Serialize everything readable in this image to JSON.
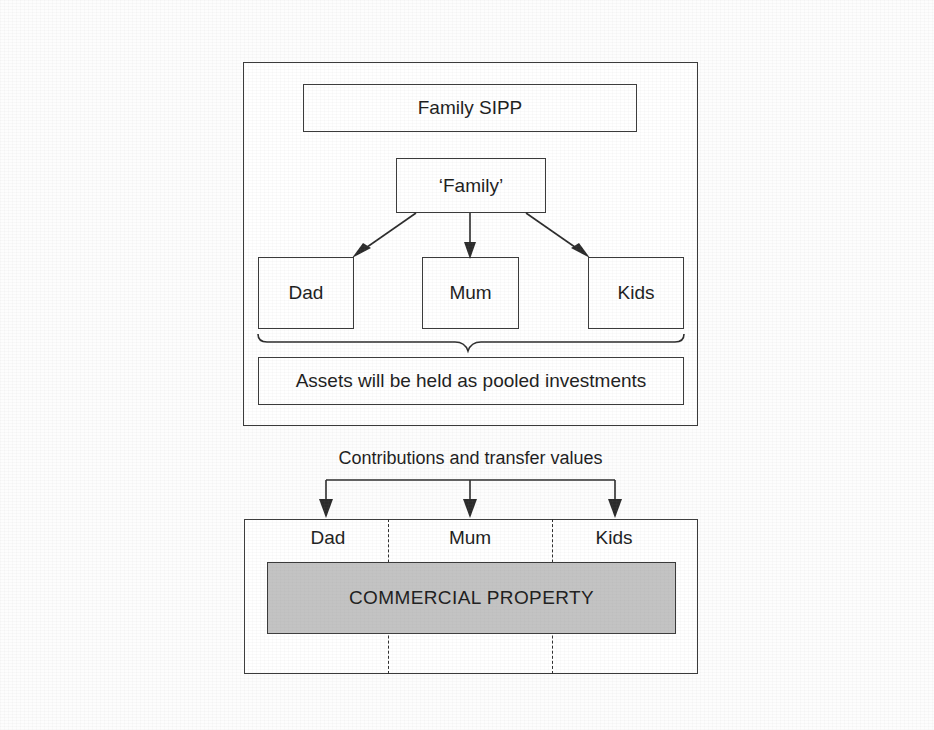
{
  "figure": {
    "background_color": "#fdfdfd",
    "line_color": "#2b2b2b",
    "shaded_fill_color": "#c3c3c3"
  },
  "top_panel": {
    "scheme_box": {
      "label": "Family SIPP"
    },
    "family_box": {
      "label": "‘Family’"
    },
    "member_boxes": [
      {
        "label": "Dad"
      },
      {
        "label": "Mum"
      },
      {
        "label": "Kids"
      }
    ],
    "pooled_box": {
      "label": "Assets will be held as pooled investments"
    }
  },
  "connector_caption": {
    "label": "Contributions and transfer values"
  },
  "bottom_panel": {
    "column_labels": [
      {
        "label": "Dad"
      },
      {
        "label": "Mum"
      },
      {
        "label": "Kids"
      }
    ],
    "asset_block": {
      "label": "COMMERCIAL PROPERTY"
    }
  }
}
